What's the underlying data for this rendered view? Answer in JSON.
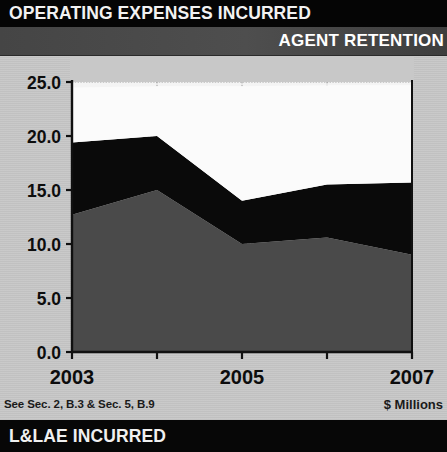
{
  "header": {
    "title": "OPERATING EXPENSES INCURRED",
    "subtitle": "AGENT RETENTION"
  },
  "footer": {
    "banner": "L&LAE INCURRED",
    "note_left": "See Sec. 2, B.3 & Sec. 5, B.9",
    "note_right": "$ Millions"
  },
  "colors": {
    "banner_top_bg": "#050505",
    "banner_sub_bg": "#4c4c4c",
    "banner_bottom_bg": "#070707",
    "page_bg": "#c8c8c8",
    "plot_bg": "#f4f4f4",
    "series_bottom": "#4a4a4a",
    "series_middle": "#0a0a0a",
    "series_top": "#fbfbfb",
    "axis": "#101010",
    "gridline": "#8a8a8a"
  },
  "chart_data": {
    "type": "area",
    "title": "OPERATING EXPENSES INCURRED",
    "subtitle": "AGENT RETENTION",
    "xlabel": "",
    "ylabel": "$ Millions",
    "stacked": true,
    "grid": true,
    "legend_position": "none",
    "x": [
      2003,
      2004,
      2005,
      2006,
      2007
    ],
    "categories": [
      "2003",
      "2004",
      "2005",
      "2006",
      "2007"
    ],
    "xtick_labels": [
      "2003",
      "",
      "2005",
      "",
      "2007"
    ],
    "ytick_labels": [
      "0.0",
      "5.0",
      "10.0",
      "15.0",
      "20.0",
      "25.0"
    ],
    "ytick_values": [
      0.0,
      5.0,
      10.0,
      15.0,
      20.0,
      25.0
    ],
    "xlim": [
      2003,
      2007
    ],
    "ylim": [
      0.0,
      25.0
    ],
    "series": [
      {
        "name": "Agent Retention",
        "color": "#4a4a4a",
        "values": [
          12.7,
          15.0,
          10.0,
          10.6,
          9.0
        ]
      },
      {
        "name": "Operating Expenses Incurred",
        "color": "#0a0a0a",
        "values": [
          6.7,
          5.0,
          4.0,
          4.9,
          6.7
        ],
        "cumulative": [
          19.4,
          20.0,
          14.0,
          15.5,
          15.7
        ]
      },
      {
        "name": "L&LAE Incurred",
        "color": "#fbfbfb",
        "values": [
          5.1,
          4.6,
          10.6,
          9.2,
          9.0
        ],
        "cumulative": [
          24.5,
          24.6,
          24.6,
          24.7,
          24.7
        ]
      }
    ]
  }
}
